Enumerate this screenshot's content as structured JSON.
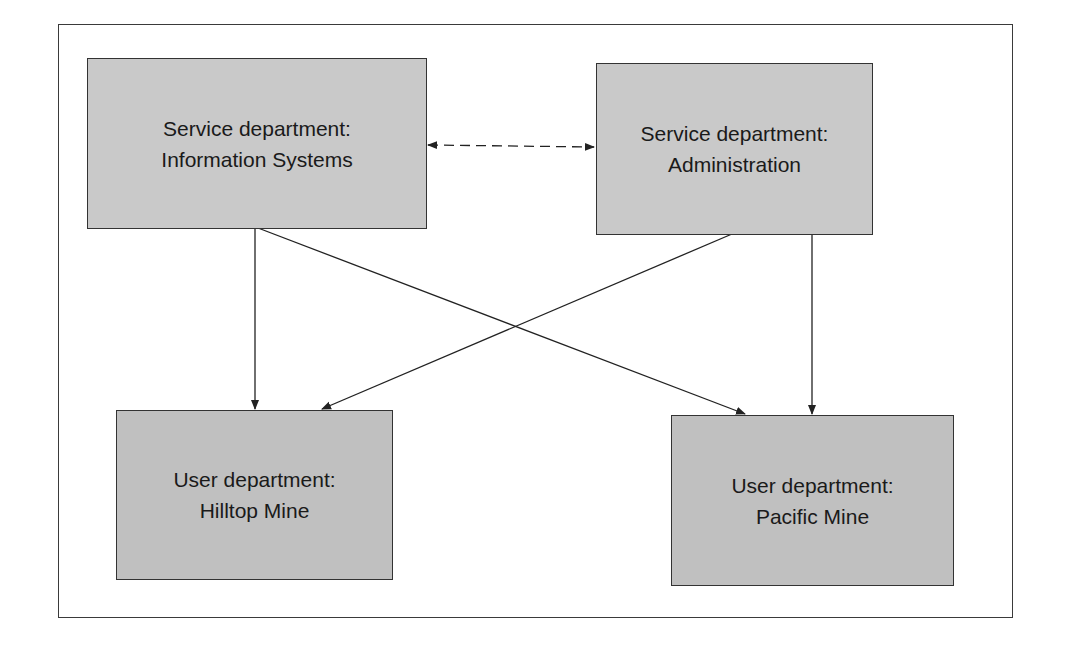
{
  "diagram": {
    "type": "department-allocation-flow",
    "colors": {
      "box_fill": "#c6c6c6",
      "border": "#333333",
      "line": "#222222",
      "background": "#ffffff"
    },
    "nodes": [
      {
        "id": "is",
        "kind": "service",
        "line1": "Service department:",
        "line2": "Information Systems"
      },
      {
        "id": "admin",
        "kind": "service",
        "line1": "Service department:",
        "line2": "Administration"
      },
      {
        "id": "hilltop",
        "kind": "user",
        "line1": "User department:",
        "line2": "Hilltop Mine"
      },
      {
        "id": "pacific",
        "kind": "user",
        "line1": "User department:",
        "line2": "Pacific Mine"
      }
    ],
    "edges": [
      {
        "from": "is",
        "to": "admin",
        "style": "dashed",
        "bidirectional": true
      },
      {
        "from": "is",
        "to": "hilltop",
        "style": "solid"
      },
      {
        "from": "is",
        "to": "pacific",
        "style": "solid"
      },
      {
        "from": "admin",
        "to": "hilltop",
        "style": "solid"
      },
      {
        "from": "admin",
        "to": "pacific",
        "style": "solid"
      }
    ]
  }
}
